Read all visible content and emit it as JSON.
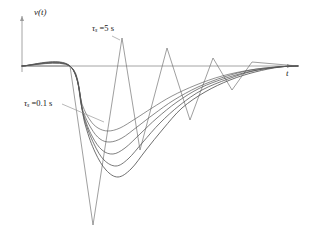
{
  "figure": {
    "background_color": "#ffffff",
    "line_color": "#4d4d4d",
    "axis_color": "#9a9a9a",
    "text_color": "#161616"
  },
  "axes": {
    "ylabel": "v(t)",
    "xlabel": "t",
    "origin_px": [
      22,
      66
    ],
    "x_axis_end_px": [
      298,
      66
    ],
    "y_axis_top_px": [
      22,
      14
    ],
    "grid": false,
    "ticks": []
  },
  "annotations": [
    {
      "name": "tau-fast-label",
      "tau_symbol": "τ",
      "subscript": "s",
      "equals": " =",
      "value": "0.1",
      "unit": " s",
      "full_text": "τs =0.1 s",
      "position_px": [
        24,
        99
      ],
      "leader_from_px": [
        62,
        104
      ],
      "leader_to_px": [
        104,
        122
      ]
    },
    {
      "name": "tau-slow-label",
      "tau_symbol": "τ",
      "subscript": "s",
      "equals": " =",
      "value": "5",
      "unit": " s",
      "full_text": "τs =5 s",
      "position_px": [
        92,
        24
      ],
      "leader_from_px": [
        112,
        36
      ],
      "leader_to_px": [
        120,
        40
      ]
    }
  ],
  "chart_data": {
    "type": "line",
    "title": "",
    "subtitle": "",
    "xlabel": "t",
    "ylabel": "v(t)",
    "xlim": [
      0,
      298
    ],
    "ylim": [
      -170,
      52
    ],
    "grid": false,
    "legend_position": "none",
    "baseline_value": 0,
    "series": [
      {
        "name": "sawtooth tau_s = 5 s",
        "style": "zigzag",
        "points_px": [
          [
            22,
            66
          ],
          [
            70,
            66
          ],
          [
            93,
            225
          ],
          [
            122,
            38
          ],
          [
            140,
            150
          ],
          [
            167,
            48
          ],
          [
            190,
            120
          ],
          [
            213,
            58
          ],
          [
            232,
            90
          ],
          [
            252,
            62
          ],
          [
            298,
            66
          ]
        ]
      },
      {
        "name": "smooth curve 1 (fastest, tau_s = 0.1 s)",
        "style": "smooth",
        "points_px": [
          [
            22,
            66
          ],
          [
            70,
            66
          ],
          [
            82,
            104
          ],
          [
            90,
            120
          ],
          [
            98,
            128
          ],
          [
            108,
            131
          ],
          [
            120,
            128
          ],
          [
            135,
            119
          ],
          [
            152,
            108
          ],
          [
            172,
            96
          ],
          [
            196,
            85
          ],
          [
            222,
            76
          ],
          [
            250,
            70
          ],
          [
            276,
            67
          ],
          [
            298,
            66
          ]
        ]
      },
      {
        "name": "smooth curve 2",
        "style": "smooth",
        "points_px": [
          [
            22,
            66
          ],
          [
            70,
            66
          ],
          [
            82,
            108
          ],
          [
            91,
            128
          ],
          [
            100,
            139
          ],
          [
            110,
            142
          ],
          [
            122,
            138
          ],
          [
            137,
            127
          ],
          [
            154,
            114
          ],
          [
            174,
            100
          ],
          [
            198,
            87
          ],
          [
            224,
            77
          ],
          [
            251,
            70
          ],
          [
            277,
            67
          ],
          [
            298,
            66
          ]
        ]
      },
      {
        "name": "smooth curve 3",
        "style": "smooth",
        "points_px": [
          [
            22,
            66
          ],
          [
            70,
            66
          ],
          [
            83,
            113
          ],
          [
            92,
            136
          ],
          [
            102,
            150
          ],
          [
            113,
            154
          ],
          [
            125,
            148
          ],
          [
            140,
            134
          ],
          [
            157,
            118
          ],
          [
            177,
            102
          ],
          [
            200,
            88
          ],
          [
            226,
            78
          ],
          [
            252,
            71
          ],
          [
            278,
            67
          ],
          [
            298,
            66
          ]
        ]
      },
      {
        "name": "smooth curve 4",
        "style": "smooth",
        "points_px": [
          [
            22,
            66
          ],
          [
            70,
            66
          ],
          [
            84,
            118
          ],
          [
            94,
            144
          ],
          [
            104,
            160
          ],
          [
            116,
            166
          ],
          [
            128,
            159
          ],
          [
            143,
            142
          ],
          [
            160,
            123
          ],
          [
            180,
            105
          ],
          [
            202,
            90
          ],
          [
            228,
            79
          ],
          [
            253,
            71
          ],
          [
            279,
            67
          ],
          [
            298,
            66
          ]
        ]
      },
      {
        "name": "smooth curve 5 (slowest of smooth family)",
        "style": "smooth",
        "points_px": [
          [
            22,
            66
          ],
          [
            70,
            66
          ],
          [
            85,
            124
          ],
          [
            95,
            152
          ],
          [
            106,
            170
          ],
          [
            118,
            177
          ],
          [
            131,
            169
          ],
          [
            146,
            150
          ],
          [
            163,
            129
          ],
          [
            182,
            108
          ],
          [
            205,
            92
          ],
          [
            230,
            80
          ],
          [
            255,
            72
          ],
          [
            280,
            67
          ],
          [
            298,
            66
          ]
        ]
      }
    ]
  }
}
